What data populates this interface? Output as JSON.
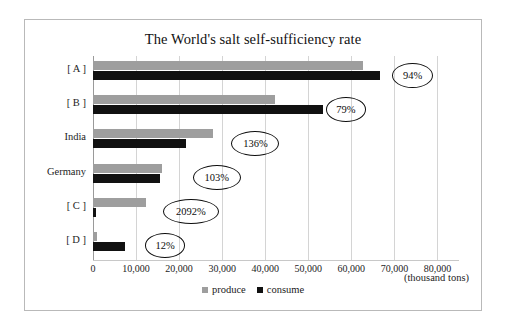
{
  "chart_data": {
    "type": "bar",
    "orientation": "horizontal",
    "title": "The World's salt self-sufficiency rate",
    "xlabel": "",
    "ylabel": "",
    "unit_label": "(thousand tons)",
    "xlim": [
      0,
      85000
    ],
    "xticks": [
      "0",
      "10,000",
      "20,000",
      "30,000",
      "40,000",
      "50,000",
      "60,000",
      "70,000",
      "80,000"
    ],
    "xtick_values": [
      0,
      10000,
      20000,
      30000,
      40000,
      50000,
      60000,
      70000,
      80000
    ],
    "grid": true,
    "legend_position": "bottom",
    "categories": [
      "[ A ]",
      "[ B ]",
      "India",
      "Germany",
      "[ C ]",
      "[ D ]"
    ],
    "series": [
      {
        "name": "produce",
        "color": "#9e9e9e",
        "values": [
          62800,
          42300,
          27800,
          16000,
          12300,
          900
        ]
      },
      {
        "name": "consume",
        "color": "#111111",
        "values": [
          66700,
          53500,
          21500,
          15600,
          600,
          7400
        ]
      }
    ],
    "annotations": [
      {
        "label": "94%",
        "category": "[ A ]",
        "x": 74000,
        "row": 0
      },
      {
        "label": "79%",
        "category": "[ B ]",
        "x": 58500,
        "row": 1
      },
      {
        "label": "136%",
        "category": "India",
        "x": 37500,
        "row": 2
      },
      {
        "label": "103%",
        "category": "Germany",
        "x": 28500,
        "row": 3
      },
      {
        "label": "2092%",
        "category": "[ C ]",
        "x": 22500,
        "row": 4
      },
      {
        "label": "12%",
        "category": "[ D ]",
        "x": 16500,
        "row": 5
      }
    ]
  },
  "legend": {
    "items": [
      {
        "label": "produce",
        "color": "#9e9e9e"
      },
      {
        "label": "consume",
        "color": "#111111"
      }
    ]
  }
}
